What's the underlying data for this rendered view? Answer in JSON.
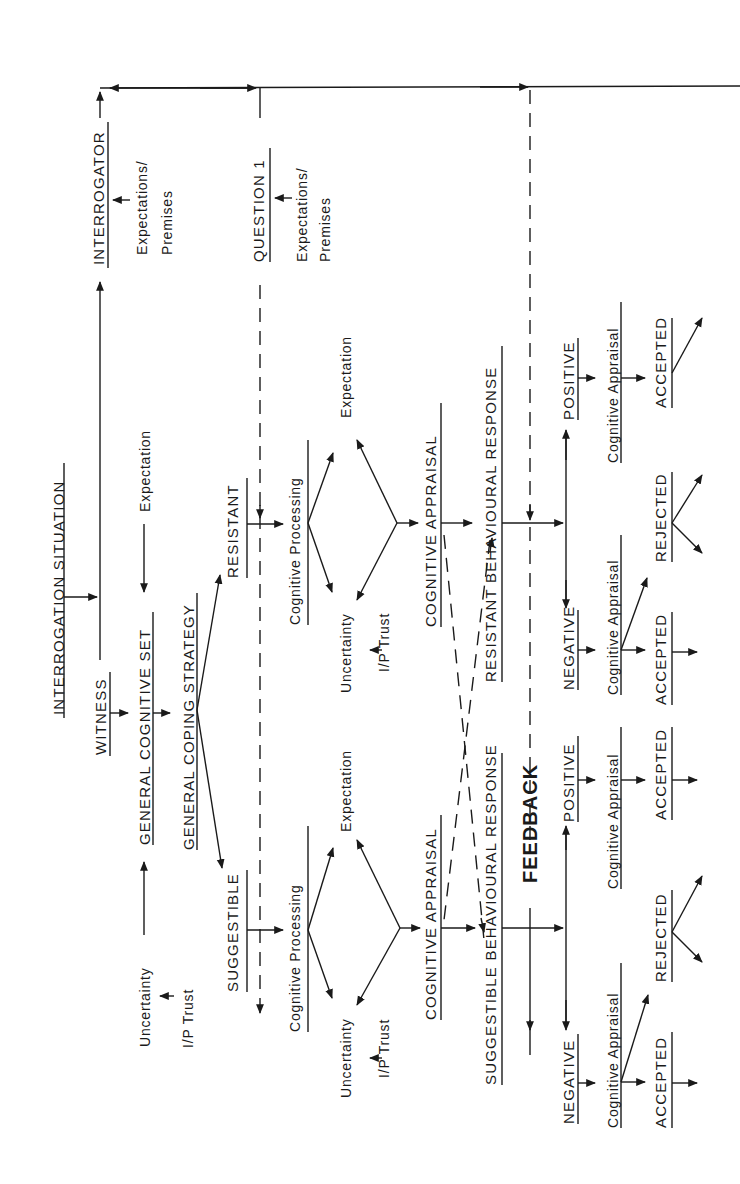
{
  "diagram": {
    "nodes": {
      "interrogator": "INTERROGATOR",
      "interrogator_expect_1": "Expectations/",
      "interrogator_expect_2": "Premises",
      "question": "QUESTION 1",
      "question_expect_1": "Expectations/",
      "question_expect_2": "Premises",
      "interrogation_situation": "INTERROGATION SITUATION",
      "witness": "WITNESS",
      "general_cognitive_set": "GENERAL COGNITIVE SET",
      "gcs_expectation": "Expectation",
      "gcs_uncertainty": "Uncertainty",
      "gcs_trust": "I/P Trust",
      "general_coping_strategy": "GENERAL COPING STRATEGY",
      "resistant": "RESISTANT",
      "suggestible": "SUGGESTIBLE",
      "feedback": "FEEDBACK"
    },
    "branches": [
      {
        "id": "resistant",
        "cognitive_processing": "Cognitive  Processing",
        "expectation": "Expectation",
        "uncertainty": "Uncertainty",
        "trust": "I/P Trust",
        "cognitive_appraisal": "COGNITIVE  APPRAISAL",
        "behavioural_response": "RESISTANT BEHAVIOURAL RESPONSE",
        "negative": "NEGATIVE",
        "positive": "POSITIVE",
        "neg_appraisal": "Cognitive Appraisal",
        "pos_appraisal": "Cognitive Appraisal",
        "neg_accepted": "ACCEPTED",
        "neg_rejected": "REJECTED",
        "pos_accepted": "ACCEPTED"
      },
      {
        "id": "suggestible",
        "cognitive_processing": "Cognitive  Processing",
        "expectation": "Expectation",
        "uncertainty": "Uncertainty",
        "trust": "I/P Trust",
        "cognitive_appraisal": "COGNITIVE  APPRAISAL",
        "behavioural_response": "SUGGESTIBLE BEHAVIOURAL RESPONSE",
        "negative": "NEGATIVE",
        "positive": "POSITIVE",
        "neg_appraisal": "Cognitive Appraisal",
        "pos_appraisal": "Cognitive Appraisal",
        "neg_accepted": "ACCEPTED",
        "neg_rejected": "REJECTED",
        "pos_accepted": "ACCEPTED"
      }
    ],
    "colors": {
      "ink": "#1a1a1a",
      "paper": "#ffffff"
    }
  }
}
